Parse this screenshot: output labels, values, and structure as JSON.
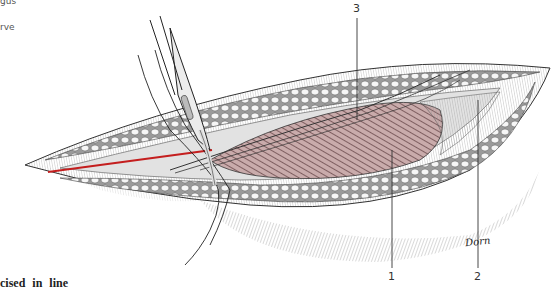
{
  "figure": {
    "side_labels": [
      "gus",
      "rve"
    ],
    "caption_fragment": "cised in line",
    "leaders": [
      {
        "label": "3",
        "x": 357,
        "label_y": 4
      },
      {
        "label": "1",
        "x": 390,
        "label_y": 272
      },
      {
        "label": "2",
        "x": 477,
        "label_y": 272
      }
    ],
    "signature": "Dorn",
    "colors": {
      "incision_line": "#c41e1e",
      "muscle": "#b89a9a",
      "muscle_dark": "#6e4a4e",
      "fat": "#f4f4f4",
      "hatch": "#888888",
      "ink": "#222222"
    }
  }
}
